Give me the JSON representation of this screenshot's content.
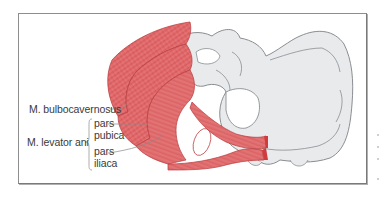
{
  "figure": {
    "type": "anatomical illustration",
    "colors": {
      "muscle_fill": "#e06a6a",
      "muscle_dark": "#c83a3a",
      "muscle_light": "#f0a0a0",
      "bone_fill": "#e8eaec",
      "bone_outline": "#8a8e92",
      "frame_border": "#7a7a7a",
      "label_text": "#3a3a3a",
      "leader_line": "#8a8a8a"
    }
  },
  "labels": {
    "bulbocavernosus": "M. bulbocavernosus",
    "levator_ani": "M. levator ani",
    "pars_pubica_1": "pars",
    "pars_pubica_2": "pubica",
    "pars_iliaca_1": "pars",
    "pars_iliaca_2": "iliaca"
  }
}
